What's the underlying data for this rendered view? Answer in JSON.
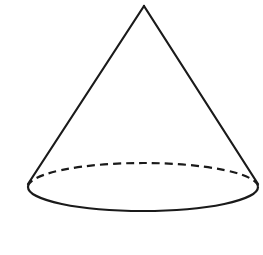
{
  "diagram": {
    "shape": "cone",
    "stroke_color": "#1a1a1a",
    "background": "#ffffff",
    "apex": {
      "x": 144,
      "y": 6
    },
    "base": {
      "cx": 143,
      "cy": 187,
      "rx": 115,
      "ry": 24
    },
    "left_slant_end": {
      "x": 28,
      "y": 184
    },
    "right_slant_end": {
      "x": 258,
      "y": 184
    },
    "hidden_edge_style": "dashed",
    "visible_edge_style": "solid"
  }
}
